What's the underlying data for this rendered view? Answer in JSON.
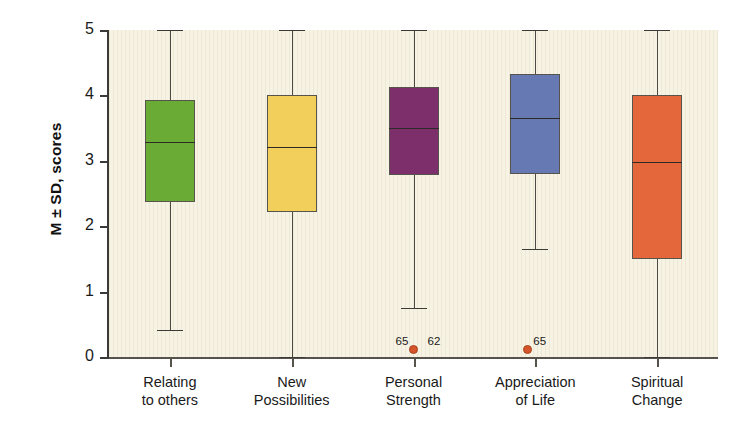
{
  "chart_data": {
    "type": "box",
    "title": "",
    "xlabel": "",
    "ylabel": "M ± SD, scores",
    "ylim": [
      0,
      5
    ],
    "yticks": [
      0,
      1,
      2,
      3,
      4,
      5
    ],
    "ytick_labels": [
      "0",
      "1",
      "2",
      "3",
      "4",
      "5"
    ],
    "grid": false,
    "legend": "none",
    "background_color": "#f7f3e4",
    "categories": [
      "Relating\nto others",
      "New\nPossibilities",
      "Personal\nStrength",
      "Appreciation\nof Life",
      "Spiritual\nChange"
    ],
    "boxes": [
      {
        "name": "Relating to others",
        "color": "#6aab35",
        "whisker_low": 0.42,
        "q1": 2.37,
        "median": 3.28,
        "q3": 3.93,
        "whisker_high": 5.0,
        "outliers": []
      },
      {
        "name": "New Possibilities",
        "color": "#f2cf5b",
        "whisker_low": 0.0,
        "q1": 2.21,
        "median": 3.21,
        "q3": 4.0,
        "whisker_high": 5.0,
        "outliers": []
      },
      {
        "name": "Personal Strength",
        "color": "#7d2f6b",
        "whisker_low": 0.75,
        "q1": 2.78,
        "median": 3.5,
        "q3": 4.13,
        "whisker_high": 5.0,
        "outliers": [
          {
            "value": 0.0,
            "label": "65",
            "label_side": "left"
          },
          {
            "value": 0.0,
            "label": "62",
            "label_side": "right"
          }
        ]
      },
      {
        "name": "Appreciation of Life",
        "color": "#6679b3",
        "whisker_low": 1.65,
        "q1": 2.8,
        "median": 3.65,
        "q3": 4.32,
        "whisker_high": 5.0,
        "outliers": [
          {
            "value": 0.0,
            "label": "65",
            "label_side": "right"
          }
        ]
      },
      {
        "name": "Spiritual Change",
        "color": "#e3673a",
        "whisker_low": 0.0,
        "q1": 1.5,
        "median": 2.98,
        "q3": 4.0,
        "whisker_high": 5.0,
        "outliers": []
      }
    ]
  }
}
